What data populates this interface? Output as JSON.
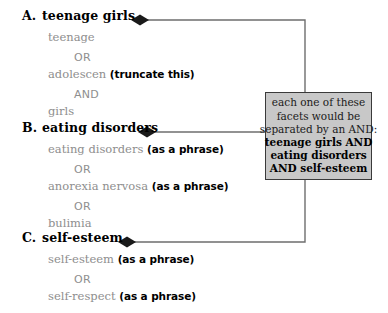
{
  "diagram": {
    "background_color": "#ffffff",
    "connector_color": "#6e6e6e",
    "term_color": "#8e8e8e",
    "note_color": "#000000",
    "callout_fill": "#c8c8c8",
    "callout_border": "#3a3a3a"
  },
  "facets": [
    {
      "letter": "A.",
      "heading": "teenage girls",
      "rows": [
        {
          "kind": "term",
          "text": "teenage",
          "note": ""
        },
        {
          "kind": "operator",
          "text": "OR"
        },
        {
          "kind": "term",
          "text": "adolescen ",
          "note": "(truncate this)"
        },
        {
          "kind": "operator",
          "text": "AND"
        },
        {
          "kind": "term",
          "text": "girls",
          "note": ""
        }
      ]
    },
    {
      "letter": "B.",
      "heading": "eating disorders",
      "rows": [
        {
          "kind": "term",
          "text": "eating disorders ",
          "note": "(as a phrase)"
        },
        {
          "kind": "operator",
          "text": "OR"
        },
        {
          "kind": "term",
          "text": "anorexia nervosa ",
          "note": "(as a phrase)"
        },
        {
          "kind": "operator",
          "text": "OR"
        },
        {
          "kind": "term",
          "text": "bulimia",
          "note": ""
        }
      ]
    },
    {
      "letter": "C.",
      "heading": "self-esteem",
      "rows": [
        {
          "kind": "term",
          "text": "self-esteem ",
          "note": "(as a phrase)"
        },
        {
          "kind": "operator",
          "text": "OR"
        },
        {
          "kind": "term",
          "text": "self-respect ",
          "note": "(as a phrase)"
        }
      ]
    }
  ],
  "callout": {
    "lines": [
      {
        "text": "each one of these",
        "bold": false
      },
      {
        "text": "facets would be",
        "bold": false
      },
      {
        "text": "separated by an AND:",
        "bold": false
      },
      {
        "text": "teenage girls AND",
        "bold": true
      },
      {
        "text": "eating disorders",
        "bold": true
      },
      {
        "text": "AND self-esteem",
        "bold": true
      }
    ]
  }
}
